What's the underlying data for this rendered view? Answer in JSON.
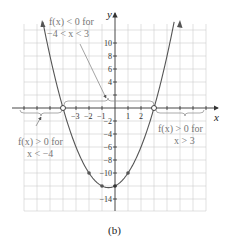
{
  "chart_data": {
    "type": "line",
    "title": "",
    "caption": "(b)",
    "xlabel": "x",
    "ylabel": "y",
    "function": "f(x) = x^2 + x - 12",
    "xlim": [
      -6.9,
      7
    ],
    "ylim": [
      -15,
      12.5
    ],
    "grid": true,
    "x_ticks": [
      -3,
      -2,
      -1,
      1,
      2
    ],
    "y_ticks": [
      10,
      8,
      6,
      4,
      2,
      -2,
      -4,
      -6,
      -8,
      -10,
      -14
    ],
    "x_tick_labels": [
      "−3",
      "−2",
      "−1",
      "1",
      "2"
    ],
    "y_tick_labels": [
      "10",
      "8",
      "6",
      "4",
      "−2",
      "−4",
      "−6",
      "−8",
      "−10",
      "−14"
    ],
    "series": [
      {
        "name": "f(x)",
        "x": [
          -5.5,
          -5,
          -4,
          -3,
          -2,
          -1,
          -0.5,
          0,
          1,
          2,
          3,
          4,
          4.5
        ],
        "values": [
          12.75,
          8,
          0,
          -6,
          -10,
          -12,
          -12.25,
          -12,
          -10,
          -6,
          0,
          8,
          12.75
        ]
      }
    ],
    "marked_points": [
      {
        "x": -2,
        "y": -10,
        "style": "filled"
      },
      {
        "x": -1,
        "y": -12,
        "style": "filled"
      },
      {
        "x": 0,
        "y": -12,
        "style": "filled"
      },
      {
        "x": 1,
        "y": -10,
        "style": "filled"
      },
      {
        "x": -4,
        "y": 0,
        "style": "open"
      },
      {
        "x": 3,
        "y": 0,
        "style": "open"
      }
    ],
    "annotations": [
      {
        "line1": "f(x) < 0 for",
        "line2": "−4 < x < 3"
      },
      {
        "line1": "f(x) > 0 for",
        "line2": "x < −4"
      },
      {
        "line1": "f(x) > 0 for",
        "line2": "x > 3"
      }
    ]
  },
  "labels": {
    "x_axis": "x",
    "y_axis": "y",
    "caption": "(b)",
    "neg_line1": "f(x) < 0 for",
    "neg_line2": "−4 < x < 3",
    "left_line1": "f(x) > 0 for",
    "left_line2": "x < −4",
    "right_line1": "f(x) > 0 for",
    "right_line2": "x > 3"
  }
}
